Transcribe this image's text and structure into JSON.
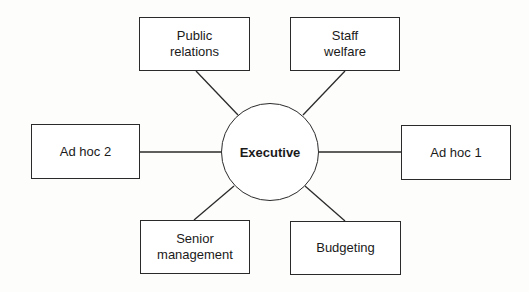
{
  "diagram": {
    "hub": {
      "label": "Executive"
    },
    "nodes": [
      {
        "id": "public-relations",
        "line1": "Public",
        "line2": "relations"
      },
      {
        "id": "staff-welfare",
        "line1": "Staff",
        "line2": "welfare"
      },
      {
        "id": "ad-hoc-2",
        "line1": "Ad hoc 2",
        "line2": ""
      },
      {
        "id": "ad-hoc-1",
        "line1": "Ad hoc 1",
        "line2": ""
      },
      {
        "id": "senior-management",
        "line1": "Senior",
        "line2": "management"
      },
      {
        "id": "budgeting",
        "line1": "Budgeting",
        "line2": ""
      }
    ],
    "edges": [
      {
        "from": "Executive",
        "to": "Public relations"
      },
      {
        "from": "Executive",
        "to": "Staff welfare"
      },
      {
        "from": "Executive",
        "to": "Ad hoc 2"
      },
      {
        "from": "Executive",
        "to": "Ad hoc 1"
      },
      {
        "from": "Executive",
        "to": "Senior management"
      },
      {
        "from": "Executive",
        "to": "Budgeting"
      }
    ],
    "colors": {
      "stroke": "#2a2a2a",
      "fill": "#ffffff",
      "text": "#1a1a1a"
    }
  }
}
